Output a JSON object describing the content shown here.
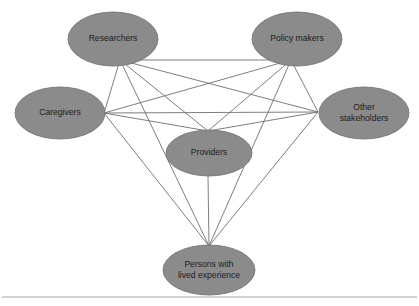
{
  "figure": {
    "type": "network-diagram",
    "background_color": "#ffffff",
    "node_fill_color": "#8b8b8b",
    "node_stroke_color": "#6d6d6d",
    "edge_color": "#6f6f6f",
    "label_color": "#1d1d1d",
    "footer_rule_color": "#9a9a9a"
  },
  "nodes": [
    {
      "id": "researchers",
      "label": "Researchers",
      "lines": [
        "Researchers"
      ],
      "cx": 113,
      "cy": 39,
      "rx": 45,
      "ry": 27
    },
    {
      "id": "policy-makers",
      "label": "Policy makers",
      "lines": [
        "Policy makers"
      ],
      "cx": 297,
      "cy": 39,
      "rx": 45,
      "ry": 27
    },
    {
      "id": "caregivers",
      "label": "Caregivers",
      "lines": [
        "Caregivers"
      ],
      "cx": 60,
      "cy": 113,
      "rx": 45,
      "ry": 26
    },
    {
      "id": "other-stakeholders",
      "label": "Other stakeholders",
      "lines": [
        "Other",
        "stakeholders"
      ],
      "cx": 364,
      "cy": 113,
      "rx": 45,
      "ry": 26
    },
    {
      "id": "providers",
      "label": "Providers",
      "lines": [
        "Providers"
      ],
      "cx": 209,
      "cy": 153,
      "rx": 43,
      "ry": 23
    },
    {
      "id": "persons-with-lived-experience",
      "label": "Persons with lived experience",
      "lines": [
        "Persons with",
        "lived experience"
      ],
      "cx": 209,
      "cy": 270,
      "rx": 46,
      "ry": 25
    }
  ],
  "edges": [
    {
      "from": "researchers",
      "to": "policy-makers",
      "x1": 120,
      "y1": 60,
      "x2": 291,
      "y2": 60
    },
    {
      "from": "researchers",
      "to": "caregivers",
      "x1": 120,
      "y1": 60,
      "x2": 104,
      "y2": 113
    },
    {
      "from": "researchers",
      "to": "other-stakeholders",
      "x1": 120,
      "y1": 60,
      "x2": 318,
      "y2": 112
    },
    {
      "from": "researchers",
      "to": "providers",
      "x1": 120,
      "y1": 60,
      "x2": 208,
      "y2": 131
    },
    {
      "from": "researchers",
      "to": "persons-with-lived-experience",
      "x1": 120,
      "y1": 60,
      "x2": 209,
      "y2": 246
    },
    {
      "from": "policy-makers",
      "to": "caregivers",
      "x1": 291,
      "y1": 60,
      "x2": 104,
      "y2": 113
    },
    {
      "from": "policy-makers",
      "to": "other-stakeholders",
      "x1": 291,
      "y1": 60,
      "x2": 318,
      "y2": 112
    },
    {
      "from": "policy-makers",
      "to": "providers",
      "x1": 291,
      "y1": 60,
      "x2": 208,
      "y2": 131
    },
    {
      "from": "policy-makers",
      "to": "persons-with-lived-experience",
      "x1": 291,
      "y1": 60,
      "x2": 209,
      "y2": 246
    },
    {
      "from": "caregivers",
      "to": "other-stakeholders",
      "x1": 104,
      "y1": 113,
      "x2": 318,
      "y2": 112
    },
    {
      "from": "caregivers",
      "to": "providers",
      "x1": 104,
      "y1": 113,
      "x2": 208,
      "y2": 131
    },
    {
      "from": "caregivers",
      "to": "persons-with-lived-experience",
      "x1": 104,
      "y1": 113,
      "x2": 209,
      "y2": 246
    },
    {
      "from": "other-stakeholders",
      "to": "providers",
      "x1": 318,
      "y1": 112,
      "x2": 208,
      "y2": 131
    },
    {
      "from": "other-stakeholders",
      "to": "persons-with-lived-experience",
      "x1": 318,
      "y1": 112,
      "x2": 209,
      "y2": 246
    },
    {
      "from": "providers",
      "to": "persons-with-lived-experience",
      "x1": 208,
      "y1": 176,
      "x2": 209,
      "y2": 246
    }
  ],
  "footer_rule": {
    "x1": 2,
    "y1": 297,
    "x2": 417,
    "y2": 297
  }
}
